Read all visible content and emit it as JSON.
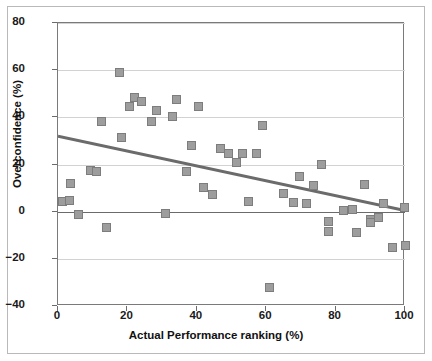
{
  "chart_data": {
    "type": "scatter",
    "title": "",
    "xlabel": "Actual Performance ranking (%)",
    "ylabel": "Overconfidence (%)",
    "xlim": [
      0,
      100
    ],
    "ylim": [
      -40,
      80
    ],
    "xticks": [
      0,
      20,
      40,
      60,
      80,
      100
    ],
    "yticks": [
      -40,
      -20,
      0,
      20,
      40,
      60,
      80
    ],
    "xtick_labels": [
      "0",
      "20",
      "40",
      "60",
      "80",
      "100"
    ],
    "ytick_labels": [
      "-40",
      "-20",
      "0",
      "20",
      "40",
      "60",
      "80"
    ],
    "grid": true,
    "grid_axis": "y",
    "legend": "none",
    "marker_color": "#9d9d9d",
    "marker_edge_color": "#7d7d7d",
    "marker_shape": "square",
    "trendline_color": "#6b6b6b",
    "zeroline_color": "#6b6b6b",
    "gridline_color": "#d2d2d2",
    "points": [
      {
        "x": 1.2,
        "y": 4.5
      },
      {
        "x": 3.2,
        "y": 4.7
      },
      {
        "x": 3.6,
        "y": 11.8
      },
      {
        "x": 5.8,
        "y": -1.4
      },
      {
        "x": 9.5,
        "y": 17.6
      },
      {
        "x": 11.0,
        "y": 17.2
      },
      {
        "x": 12.5,
        "y": 38.1
      },
      {
        "x": 14.1,
        "y": -6.9
      },
      {
        "x": 17.6,
        "y": 58.8
      },
      {
        "x": 18.2,
        "y": 31.5
      },
      {
        "x": 22.0,
        "y": 48.2
      },
      {
        "x": 24.0,
        "y": 46.6
      },
      {
        "x": 20.5,
        "y": 44.5
      },
      {
        "x": 27.0,
        "y": 38.2
      },
      {
        "x": 28.3,
        "y": 43.1
      },
      {
        "x": 31.0,
        "y": -0.6
      },
      {
        "x": 33.0,
        "y": 40.2
      },
      {
        "x": 34.2,
        "y": 47.6
      },
      {
        "x": 36.9,
        "y": 16.9
      },
      {
        "x": 38.6,
        "y": 28.2
      },
      {
        "x": 40.6,
        "y": 44.8
      },
      {
        "x": 42.0,
        "y": 10.1
      },
      {
        "x": 44.6,
        "y": 7.1
      },
      {
        "x": 46.7,
        "y": 26.6
      },
      {
        "x": 49.2,
        "y": 24.5
      },
      {
        "x": 51.3,
        "y": 20.7
      },
      {
        "x": 53.3,
        "y": 24.5
      },
      {
        "x": 55.0,
        "y": 4.5
      },
      {
        "x": 57.3,
        "y": 24.5
      },
      {
        "x": 59.0,
        "y": 36.6
      },
      {
        "x": 61.0,
        "y": -32.0
      },
      {
        "x": 65.1,
        "y": 7.9
      },
      {
        "x": 68.0,
        "y": 3.7
      },
      {
        "x": 69.5,
        "y": 15.1
      },
      {
        "x": 71.5,
        "y": 3.3
      },
      {
        "x": 73.5,
        "y": 11.3
      },
      {
        "x": 76.0,
        "y": 20.1
      },
      {
        "x": 77.9,
        "y": -8.2
      },
      {
        "x": 78.0,
        "y": -4.0
      },
      {
        "x": 82.4,
        "y": 0.7
      },
      {
        "x": 85.0,
        "y": 1.1
      },
      {
        "x": 85.9,
        "y": -9.0
      },
      {
        "x": 88.2,
        "y": 11.7
      },
      {
        "x": 90.0,
        "y": -3.5
      },
      {
        "x": 90.2,
        "y": -4.8
      },
      {
        "x": 92.3,
        "y": -2.6
      },
      {
        "x": 93.9,
        "y": 3.3
      },
      {
        "x": 96.3,
        "y": -15.4
      },
      {
        "x": 99.8,
        "y": 1.6
      },
      {
        "x": 100.0,
        "y": -14.5
      }
    ],
    "trendline": {
      "x0": 0,
      "y0": 32.0,
      "x1": 100,
      "y1": 0.5
    }
  }
}
